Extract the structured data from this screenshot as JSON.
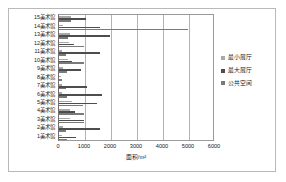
{
  "chart_data": {
    "type": "bar",
    "orientation": "horizontal",
    "title": "",
    "xlabel": "面积/m²",
    "ylabel": "",
    "xlim": [
      0,
      6000
    ],
    "xticks": [
      0,
      1000,
      2000,
      3000,
      4000,
      5000,
      6000
    ],
    "xtick_labels": [
      "0",
      "1000",
      "2000",
      "3000",
      "4000",
      "5000",
      "6000"
    ],
    "grid": "vertical",
    "legend_position": "right",
    "categories": [
      "15美术馆",
      "14美术馆",
      "13美术馆",
      "12美术馆",
      "11美术馆",
      "10美术馆",
      "9美术馆",
      "8美术馆",
      "7美术馆",
      "6美术馆",
      "5美术馆",
      "4美术馆",
      "3美术馆",
      "2美术馆",
      "1美术馆"
    ],
    "series": [
      {
        "name": "最小展厅",
        "color": "#a8a8a8",
        "values": [
          480,
          150,
          430,
          400,
          130,
          330,
          160,
          90,
          100,
          120,
          500,
          430,
          420,
          140,
          130
        ]
      },
      {
        "name": "最大展厅",
        "color": "#4d4d4d",
        "values": [
          1030,
          1560,
          1970,
          560,
          1580,
          500,
          840,
          0,
          1080,
          1650,
          1480,
          620,
          960,
          1570,
          640
        ]
      },
      {
        "name": "公共空间",
        "color": "#7a7a7a",
        "values": [
          470,
          4950,
          330,
          960,
          280,
          980,
          310,
          120,
          250,
          300,
          910,
          950,
          980,
          250,
          300
        ]
      }
    ]
  },
  "legend": {
    "items": [
      {
        "label": "最小展厅",
        "color": "#a8a8a8"
      },
      {
        "label": "最大展厅",
        "color": "#4d4d4d"
      },
      {
        "label": "公共空间",
        "color": "#7a7a7a"
      }
    ]
  },
  "axis": {
    "x_title": "面积/m²",
    "tick_labels": [
      "0",
      "1000",
      "2000",
      "3000",
      "4000",
      "5000",
      "6000"
    ]
  }
}
